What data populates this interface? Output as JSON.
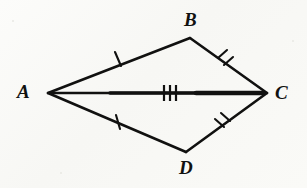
{
  "figure": {
    "background_color": "#fbfbf9",
    "ink_color": "#111110",
    "vertices": [
      {
        "id": "A",
        "label": "A",
        "x": 48,
        "y": 93
      },
      {
        "id": "B",
        "label": "B",
        "x": 190,
        "y": 38
      },
      {
        "id": "C",
        "label": "C",
        "x": 267,
        "y": 93
      },
      {
        "id": "D",
        "label": "D",
        "x": 186,
        "y": 152
      }
    ],
    "segments": [
      {
        "id": "AB",
        "from": "A",
        "to": "B",
        "tick_count": 1,
        "stroke_width": 2.6
      },
      {
        "id": "BC",
        "from": "B",
        "to": "C",
        "tick_count": 2,
        "stroke_width": 2.6
      },
      {
        "id": "AD",
        "from": "A",
        "to": "D",
        "tick_count": 1,
        "stroke_width": 2.6
      },
      {
        "id": "DC",
        "from": "D",
        "to": "C",
        "tick_count": 2,
        "stroke_width": 2.6
      },
      {
        "id": "AC",
        "from": "A",
        "to": "C",
        "tick_count": 3,
        "stroke_width": 4.2,
        "is_diagonal": true
      }
    ],
    "tick_marks": [
      {
        "id": "tick-AB",
        "segment": "AB",
        "count": 1,
        "x": 118,
        "y": 59
      },
      {
        "id": "tick-BC",
        "segment": "BC",
        "count": 2,
        "x": 226,
        "y": 61
      },
      {
        "id": "tick-AD",
        "segment": "AD",
        "count": 1,
        "x": 118,
        "y": 122
      },
      {
        "id": "tick-DC",
        "segment": "DC",
        "count": 2,
        "x": 223,
        "y": 124
      },
      {
        "id": "tick-AC",
        "segment": "AC",
        "count": 3,
        "x": 170,
        "y": 93
      }
    ]
  }
}
